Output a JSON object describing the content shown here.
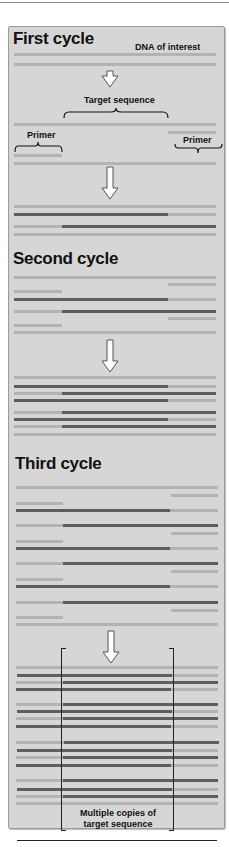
{
  "diagram": {
    "type": "pcr-amplification",
    "colors": {
      "panel_bg": "#d6d6d6",
      "original_strand": "#b3b3b3",
      "new_strand": "#5e5e5e",
      "text": "#111111"
    },
    "sections": [
      {
        "title": "First cycle",
        "annotation": "DNA of interest"
      },
      {
        "title": "Second cycle"
      },
      {
        "title": "Third cycle"
      }
    ],
    "labels": {
      "dna_of_interest": "DNA of interest",
      "target_sequence": "Target sequence",
      "primer_left": "Primer",
      "primer_right": "Primer",
      "result_line1": "Multiple copies of",
      "result_line2": "target sequence"
    },
    "geometry": {
      "x_left": 14,
      "x_split_left": 62,
      "x_split_right": 168,
      "x_right": 216
    },
    "rows": [
      {
        "y": 53,
        "segs": [
          [
            "light",
            14,
            216
          ]
        ]
      },
      {
        "y": 63,
        "segs": [
          [
            "light",
            14,
            216
          ]
        ]
      },
      {
        "y": 123,
        "segs": [
          [
            "light",
            14,
            216
          ]
        ]
      },
      {
        "y": 131,
        "segs": [
          [
            "light",
            168,
            216
          ]
        ]
      },
      {
        "y": 154,
        "segs": [
          [
            "light",
            14,
            62
          ]
        ]
      },
      {
        "y": 162,
        "segs": [
          [
            "light",
            14,
            216
          ]
        ]
      },
      {
        "y": 205,
        "segs": [
          [
            "light",
            14,
            216
          ]
        ]
      },
      {
        "y": 213,
        "segs": [
          [
            "dark",
            14,
            168
          ],
          [
            "light",
            168,
            216
          ]
        ]
      },
      {
        "y": 225,
        "segs": [
          [
            "light",
            14,
            62
          ],
          [
            "dark",
            62,
            216
          ]
        ]
      },
      {
        "y": 233,
        "segs": [
          [
            "light",
            14,
            216
          ]
        ]
      },
      {
        "y": 276,
        "segs": [
          [
            "light",
            14,
            216
          ]
        ]
      },
      {
        "y": 283,
        "segs": [
          [
            "light",
            168,
            216
          ]
        ]
      },
      {
        "y": 290,
        "segs": [
          [
            "light",
            14,
            62
          ]
        ]
      },
      {
        "y": 298,
        "segs": [
          [
            "dark",
            14,
            168
          ],
          [
            "light",
            168,
            216
          ]
        ]
      },
      {
        "y": 310,
        "segs": [
          [
            "light",
            14,
            62
          ],
          [
            "dark",
            62,
            216
          ]
        ]
      },
      {
        "y": 317,
        "segs": [
          [
            "light",
            168,
            216
          ]
        ]
      },
      {
        "y": 324,
        "segs": [
          [
            "light",
            14,
            62
          ]
        ]
      },
      {
        "y": 331,
        "segs": [
          [
            "light",
            14,
            216
          ]
        ]
      },
      {
        "y": 376,
        "segs": [
          [
            "light",
            14,
            216
          ]
        ]
      },
      {
        "y": 385,
        "segs": [
          [
            "dark",
            14,
            168
          ],
          [
            "light",
            168,
            216
          ]
        ]
      },
      {
        "y": 392,
        "segs": [
          [
            "light",
            14,
            62
          ],
          [
            "dark",
            62,
            216
          ]
        ]
      },
      {
        "y": 399,
        "segs": [
          [
            "dark",
            14,
            168
          ],
          [
            "light",
            168,
            216
          ]
        ]
      },
      {
        "y": 411,
        "segs": [
          [
            "light",
            14,
            62
          ],
          [
            "dark",
            62,
            216
          ]
        ]
      },
      {
        "y": 418,
        "segs": [
          [
            "dark",
            14,
            168
          ],
          [
            "light",
            168,
            216
          ]
        ]
      },
      {
        "y": 425,
        "segs": [
          [
            "light",
            14,
            62
          ],
          [
            "dark",
            62,
            216
          ]
        ]
      },
      {
        "y": 433,
        "segs": [
          [
            "light",
            14,
            216
          ]
        ]
      },
      {
        "y": 486,
        "segs": [
          [
            "light",
            16,
            218
          ]
        ]
      },
      {
        "y": 494,
        "segs": [
          [
            "light",
            171,
            218
          ]
        ]
      },
      {
        "y": 502,
        "segs": [
          [
            "light",
            16,
            63
          ]
        ]
      },
      {
        "y": 509,
        "segs": [
          [
            "dark",
            16,
            170
          ],
          [
            "light",
            170,
            218
          ]
        ]
      },
      {
        "y": 524,
        "segs": [
          [
            "light",
            16,
            63
          ],
          [
            "dark",
            63,
            218
          ]
        ]
      },
      {
        "y": 532,
        "segs": [
          [
            "light",
            171,
            218
          ]
        ]
      },
      {
        "y": 540,
        "segs": [
          [
            "light",
            16,
            63
          ]
        ]
      },
      {
        "y": 547,
        "segs": [
          [
            "dark",
            16,
            170
          ],
          [
            "light",
            170,
            218
          ]
        ]
      },
      {
        "y": 562,
        "segs": [
          [
            "light",
            16,
            63
          ],
          [
            "dark",
            63,
            218
          ]
        ]
      },
      {
        "y": 570,
        "segs": [
          [
            "light",
            171,
            218
          ]
        ]
      },
      {
        "y": 578,
        "segs": [
          [
            "light",
            16,
            63
          ]
        ]
      },
      {
        "y": 585,
        "segs": [
          [
            "dark",
            16,
            170
          ],
          [
            "light",
            170,
            218
          ]
        ]
      },
      {
        "y": 601,
        "segs": [
          [
            "light",
            16,
            63
          ],
          [
            "dark",
            63,
            218
          ]
        ]
      },
      {
        "y": 609,
        "segs": [
          [
            "light",
            171,
            218
          ]
        ]
      },
      {
        "y": 616,
        "segs": [
          [
            "light",
            16,
            63
          ]
        ]
      },
      {
        "y": 623,
        "segs": [
          [
            "light",
            16,
            218
          ]
        ]
      },
      {
        "y": 666,
        "segs": [
          [
            "light",
            16,
            218
          ]
        ]
      },
      {
        "y": 674,
        "segs": [
          [
            "dark",
            17,
            172
          ],
          [
            "light",
            172,
            218
          ]
        ]
      },
      {
        "y": 681,
        "segs": [
          [
            "light",
            16,
            63
          ],
          [
            "dark",
            63,
            218
          ]
        ]
      },
      {
        "y": 688,
        "segs": [
          [
            "dark",
            16,
            171
          ],
          [
            "light",
            171,
            218
          ]
        ]
      },
      {
        "y": 703,
        "segs": [
          [
            "light",
            16,
            63
          ],
          [
            "dark",
            63,
            218
          ]
        ]
      },
      {
        "y": 710,
        "segs": [
          [
            "dark",
            17,
            172
          ],
          [
            "light",
            172,
            218
          ]
        ]
      },
      {
        "y": 717,
        "segs": [
          [
            "light",
            16,
            63
          ],
          [
            "dark",
            63,
            218
          ]
        ]
      },
      {
        "y": 725,
        "segs": [
          [
            "dark",
            16,
            171
          ],
          [
            "light",
            171,
            218
          ]
        ]
      },
      {
        "y": 741,
        "segs": [
          [
            "light",
            16,
            64
          ],
          [
            "dark",
            64,
            219
          ]
        ]
      },
      {
        "y": 749,
        "segs": [
          [
            "dark",
            17,
            172
          ],
          [
            "light",
            172,
            218
          ]
        ]
      },
      {
        "y": 756,
        "segs": [
          [
            "light",
            16,
            63
          ],
          [
            "dark",
            63,
            218
          ]
        ]
      },
      {
        "y": 764,
        "segs": [
          [
            "dark",
            16,
            171
          ],
          [
            "light",
            171,
            218
          ]
        ]
      },
      {
        "y": 779,
        "segs": [
          [
            "light",
            16,
            63
          ],
          [
            "dark",
            63,
            218
          ]
        ]
      },
      {
        "y": 788,
        "segs": [
          [
            "dark",
            17,
            172
          ],
          [
            "light",
            172,
            218
          ]
        ]
      },
      {
        "y": 795,
        "segs": [
          [
            "light",
            16,
            63
          ],
          [
            "dark",
            63,
            218
          ]
        ]
      },
      {
        "y": 802,
        "segs": [
          [
            "light",
            16,
            218
          ]
        ]
      }
    ],
    "arrows": [
      {
        "x": 101,
        "y": 70,
        "shaft_h": 6,
        "name": "arrow-step-1"
      },
      {
        "x": 101,
        "y": 166,
        "shaft_h": 22,
        "name": "arrow-step-2"
      },
      {
        "x": 101,
        "y": 339,
        "shaft_h": 22,
        "name": "arrow-step-3"
      },
      {
        "x": 102,
        "y": 630,
        "shaft_h": 22,
        "name": "arrow-step-4"
      }
    ]
  }
}
